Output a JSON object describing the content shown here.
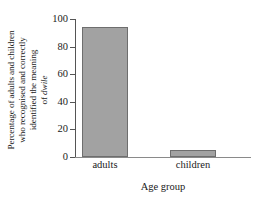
{
  "chart_data": {
    "type": "bar",
    "title": "",
    "categories": [
      "adults",
      "children"
    ],
    "values": [
      94,
      5
    ],
    "xlabel": "Age group",
    "ylabel_lines": [
      "Percentage of adults and children",
      "who recognised and correctly",
      "identified the meaning",
      "of dwile"
    ],
    "ylabel_italic_word": "dwile",
    "ylabel_last_line_prefix": "of ",
    "ylim": [
      0,
      100
    ],
    "yticks": [
      0,
      20,
      40,
      60,
      80,
      100
    ],
    "ytick_labels": [
      "0",
      "20",
      "40",
      "60",
      "80",
      "100"
    ],
    "grid": false,
    "legend": false,
    "colors": {
      "bar_fill": "#a2a2a2",
      "bar_edge": "#6e6e6e",
      "axis": "#555555",
      "text": "#1a1a1a",
      "background": "#ffffff"
    }
  }
}
